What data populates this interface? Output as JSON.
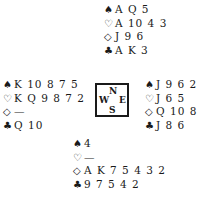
{
  "diagram": {
    "type": "bridge-deal",
    "compass": {
      "north": "N",
      "south": "S",
      "west": "W",
      "east": "E"
    },
    "suit_symbols": {
      "spades": "♠",
      "hearts": "♡",
      "diamonds": "◇",
      "clubs": "♣"
    },
    "hands": {
      "north": {
        "spades": "A Q 5",
        "hearts": "A 10 4 3",
        "diamonds": "J 9 6",
        "clubs": "A K 3"
      },
      "west": {
        "spades": "K 10 8 7 5",
        "hearts": "K Q 9 8 7 2",
        "diamonds": "—",
        "clubs": "Q 10"
      },
      "east": {
        "spades": "J 9 6 2",
        "hearts": "J 6 5",
        "diamonds": "Q 10 8",
        "clubs": "J 8 6"
      },
      "south": {
        "spades": "4",
        "hearts": "—",
        "diamonds": "A K 7 5 4 3 2",
        "clubs": "9 7 5 4 2"
      }
    }
  }
}
